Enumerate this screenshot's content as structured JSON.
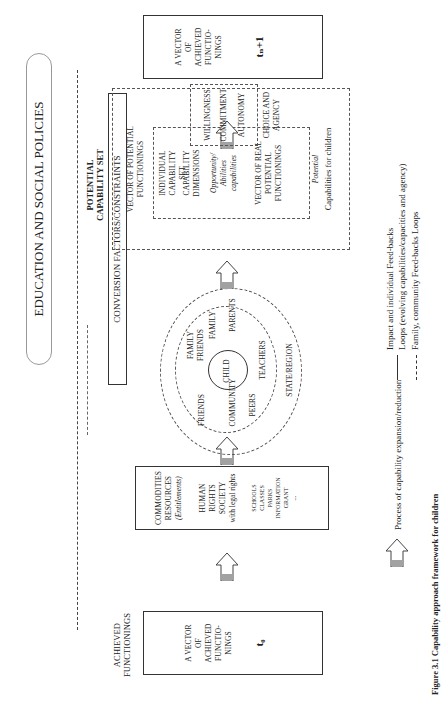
{
  "policies_banner": "EDUCATION AND SOCIAL POLICIES",
  "achieved_t0": {
    "heading": "ACHIEVED FUNCTIONINGS",
    "lines": [
      "A VECTOR",
      "OF",
      "ACHIEVED",
      "FUNCTIO-",
      "NINGS"
    ],
    "time": "t₀"
  },
  "commodities": {
    "lines": [
      "COMMODITIES",
      "RESOURCES"
    ],
    "entitlements": "(Entitlements)",
    "rights": [
      "HUMAN",
      "RIGHTS",
      "SOCIETY",
      "with legal rights"
    ],
    "examples": [
      "SCHOOLS",
      "CLASSES",
      "PARKS",
      "INFORMATION",
      "GRANT",
      "..."
    ]
  },
  "conversion": "CONVERSION FACTORS/CONSTRAINTS",
  "circles": {
    "center": "CHILD",
    "inner": [
      "FAMILY FRIENDS",
      "FAMILY",
      "PARENTS",
      "FRIENDS",
      "COMMUNITY",
      "PEERS",
      "TEACHERS"
    ],
    "outer": "STATE/REGION"
  },
  "potential": {
    "title": "POTENTIAL CAPABILITY SET",
    "vector": "VECTOR OF POTENTIAL FUNCTIONINGS",
    "individual": "INDIVIDUAL CAPABILITY SET",
    "dimensions": "CAPABILITY DIMENSIONS",
    "opportunity": "Opportunity/ Abilities capabilities",
    "real": "VECTOR OF REAL POTENTIAL FUNCTIONINGS",
    "potential_italic": "Potential",
    "for_children": "Capabilities for children"
  },
  "choice": {
    "items": [
      "WILLINGNESS",
      "COMMITMENT",
      "AUTONOMY"
    ],
    "label": "CHOICE AND AGENCY"
  },
  "achieved_t1": {
    "lines": [
      "A VECTOR",
      "OF",
      "ACHIEVED",
      "FUNCTIO-",
      "NINGS"
    ],
    "time": "tₙ+1"
  },
  "legend": {
    "process": "Process of capability expansion/reduction",
    "impact_1": "Impact and individual Feed-backs",
    "impact_2": "Loops (evolving capabilities/capacities and agency)",
    "family": "Family, community Feed-backs Loops"
  },
  "caption": "Figure 3.1 Capability approach framework for children"
}
